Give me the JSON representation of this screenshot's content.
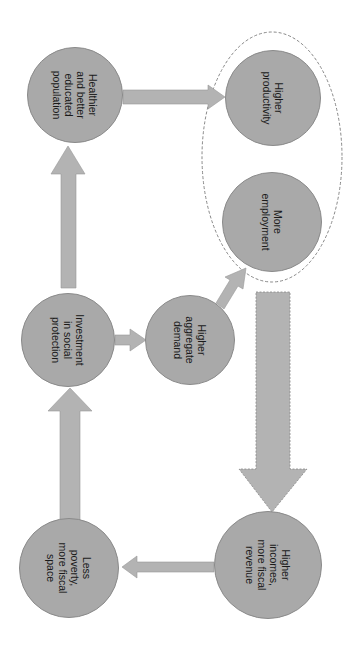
{
  "diagram": {
    "orientation": "rotated-90-clockwise",
    "colors": {
      "node_fill": "#a9a9a9",
      "node_stroke": "#8a8a8a",
      "arrow_fill": "#b3b3b3",
      "dashed_outline": "#888888"
    },
    "nodes": [
      {
        "id": "healthier",
        "label": "Healthier\nand better\neducated\npopulation",
        "cx": 75,
        "cy": 95,
        "r": 48
      },
      {
        "id": "productivity",
        "label": "Higher\nproductivity",
        "cx": 273,
        "cy": 98,
        "r": 48
      },
      {
        "id": "employment",
        "label": "More\nemployment",
        "cx": 272,
        "cy": 222,
        "r": 50
      },
      {
        "id": "investment",
        "label": "Investment\nin social\nprotection",
        "cx": 68,
        "cy": 340,
        "r": 47
      },
      {
        "id": "demand",
        "label": "Higher\naggregate\ndemand",
        "cx": 190,
        "cy": 340,
        "r": 45
      },
      {
        "id": "poverty",
        "label": "Less\npoverty,\nmore fiscal\nspace",
        "cx": 69,
        "cy": 568,
        "r": 50
      },
      {
        "id": "incomes",
        "label": "Higher\nincomes,\nmore fiscal\nrevenue",
        "cx": 268,
        "cy": 565,
        "r": 54
      }
    ],
    "edges": [
      {
        "from": "investment",
        "to": "healthier"
      },
      {
        "from": "healthier",
        "to": "productivity"
      },
      {
        "from": "investment",
        "to": "demand"
      },
      {
        "from": "demand",
        "to": "employment"
      },
      {
        "from": "employment",
        "to": "incomes",
        "style": "dashed-large"
      },
      {
        "from": "incomes",
        "to": "poverty"
      },
      {
        "from": "poverty",
        "to": "investment"
      }
    ],
    "group": {
      "members": [
        "productivity",
        "employment"
      ],
      "style": "dashed-ellipse"
    }
  }
}
